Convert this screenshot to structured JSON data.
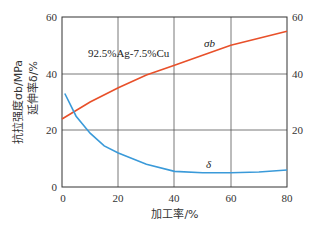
{
  "chart_data": {
    "type": "line",
    "title": "",
    "annotation": "92.5%Ag-7.5%Cu",
    "xlabel": "加工率/%",
    "ylabel_line1": "抗拉强度σb/MPa",
    "ylabel_line2": "延伸率δ/%",
    "xlim": [
      0,
      80
    ],
    "ylim": [
      0,
      60
    ],
    "y2lim": [
      0,
      60
    ],
    "x_ticks": [
      "0",
      "20",
      "40",
      "60",
      "80"
    ],
    "y_ticks": [
      "0",
      "20",
      "40",
      "60"
    ],
    "y2_ticks": [
      "20",
      "40",
      "60"
    ],
    "grid": true,
    "series": [
      {
        "name": "σb",
        "label": "σb",
        "color": "#e8502a",
        "x": [
          0,
          10,
          20,
          30,
          40,
          50,
          60,
          70,
          80
        ],
        "values": [
          24,
          30,
          35,
          39.5,
          43,
          46.5,
          50,
          52.5,
          55
        ]
      },
      {
        "name": "δ",
        "label": "δ",
        "color": "#3a9ad9",
        "x": [
          1,
          5,
          10,
          15,
          20,
          30,
          40,
          50,
          60,
          70,
          80
        ],
        "values": [
          33,
          25,
          19,
          14.5,
          12,
          8,
          5.5,
          5,
          5,
          5.3,
          6
        ]
      }
    ]
  }
}
